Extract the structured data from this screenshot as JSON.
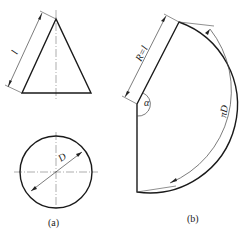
{
  "figure_a": {
    "caption": "(a)",
    "cone_slant_label": "l",
    "base_diameter_label": "D"
  },
  "figure_b": {
    "caption": "(b)",
    "radius_label": "R=l",
    "angle_label": "α",
    "arc_label": "πD"
  },
  "colors": {
    "line": "#1a1a1a",
    "dim": "#444444"
  }
}
